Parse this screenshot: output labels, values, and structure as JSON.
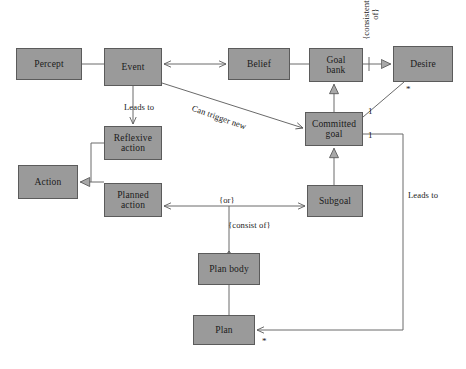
{
  "diagram": {
    "type": "uml-class-diagram",
    "canvas": {
      "width": 466,
      "height": 369,
      "background": "#ffffff"
    },
    "style": {
      "node_fill": "#9a9a9a",
      "node_border": "#5b5b5b",
      "edge_color": "#5b5b5b",
      "text_color": "#1a1a1a"
    },
    "nodes": [
      {
        "id": "percept",
        "label": "Percept",
        "x": 16,
        "y": 48,
        "w": 66,
        "h": 32
      },
      {
        "id": "event",
        "label": "Event",
        "x": 104,
        "y": 48,
        "w": 58,
        "h": 38
      },
      {
        "id": "belief",
        "label": "Belief",
        "x": 228,
        "y": 48,
        "w": 62,
        "h": 32
      },
      {
        "id": "goal_bank",
        "label": "Goal\nbank",
        "x": 309,
        "y": 48,
        "w": 54,
        "h": 34
      },
      {
        "id": "desire",
        "label": "Desire",
        "x": 393,
        "y": 46,
        "w": 60,
        "h": 36
      },
      {
        "id": "committed_goal",
        "label": "Committed\ngoal",
        "x": 305,
        "y": 112,
        "w": 58,
        "h": 34
      },
      {
        "id": "reflexive",
        "label": "Reflexive\naction",
        "x": 104,
        "y": 126,
        "w": 58,
        "h": 34
      },
      {
        "id": "action",
        "label": "Action",
        "x": 18,
        "y": 165,
        "w": 60,
        "h": 34
      },
      {
        "id": "planned",
        "label": "Planned\naction",
        "x": 104,
        "y": 183,
        "w": 58,
        "h": 34
      },
      {
        "id": "subgoal",
        "label": "Subgoal",
        "x": 307,
        "y": 185,
        "w": 56,
        "h": 32
      },
      {
        "id": "plan_body",
        "label": "Plan body",
        "x": 198,
        "y": 253,
        "w": 62,
        "h": 32
      },
      {
        "id": "plan",
        "label": "Plan",
        "x": 193,
        "y": 315,
        "w": 62,
        "h": 30
      }
    ],
    "edge_labels": [
      {
        "id": "leads-to-reflexive",
        "text": "Leads to",
        "x": 124,
        "y": 102
      },
      {
        "id": "can-trigger-new",
        "text": "Can trigger new",
        "x": 194,
        "y": 103
      },
      {
        "id": "consistent-set-of",
        "text": "{consistent set of}",
        "x": 366,
        "y": 46
      },
      {
        "id": "or",
        "text": "{or}",
        "x": 219,
        "y": 196
      },
      {
        "id": "consist-of",
        "text": "{consist of}",
        "x": 228,
        "y": 221
      },
      {
        "id": "leads-to-plan",
        "text": "Leads to",
        "x": 406,
        "y": 192
      }
    ],
    "multiplicities": [
      {
        "id": "desire-star",
        "text": "*",
        "x": 406,
        "y": 88
      },
      {
        "id": "committed-one-upper",
        "text": "1",
        "x": 368,
        "y": 110
      },
      {
        "id": "committed-one-lower",
        "text": "1",
        "x": 368,
        "y": 133
      },
      {
        "id": "plan-star",
        "text": "*",
        "x": 262,
        "y": 342
      }
    ],
    "edges": [
      {
        "id": "percept-event",
        "from": "percept",
        "to": "event",
        "kind": "association",
        "arrows": "none"
      },
      {
        "id": "event-belief",
        "from": "event",
        "to": "belief",
        "kind": "association",
        "arrows": "both"
      },
      {
        "id": "belief-goalbank",
        "from": "belief",
        "to": "goal_bank",
        "kind": "association",
        "arrows": "none"
      },
      {
        "id": "goalbank-desire",
        "from": "goal_bank",
        "to": "desire",
        "kind": "generalization",
        "arrows": "target"
      },
      {
        "id": "committed-goalbank",
        "from": "committed_goal",
        "to": "goal_bank",
        "kind": "generalization",
        "arrows": "target"
      },
      {
        "id": "committed-desire",
        "from": "committed_goal",
        "to": "desire",
        "kind": "association",
        "arrows": "none"
      },
      {
        "id": "event-reflexive",
        "from": "event",
        "to": "reflexive",
        "kind": "association",
        "arrows": "target"
      },
      {
        "id": "event-committed",
        "from": "event",
        "to": "committed_goal",
        "kind": "association",
        "arrows": "target"
      },
      {
        "id": "reflexive-action",
        "from": "reflexive",
        "to": "action",
        "kind": "generalization",
        "arrows": "target"
      },
      {
        "id": "planned-action",
        "from": "planned",
        "to": "action",
        "kind": "generalization",
        "arrows": "target"
      },
      {
        "id": "subgoal-committed",
        "from": "subgoal",
        "to": "committed_goal",
        "kind": "generalization",
        "arrows": "target"
      },
      {
        "id": "planned-subgoal",
        "from": "planned",
        "to": "subgoal",
        "kind": "association",
        "arrows": "both"
      },
      {
        "id": "planbody-or-junction",
        "from": "plan_body",
        "to": "planned-subgoal",
        "kind": "aggregation",
        "arrows": "diamond"
      },
      {
        "id": "planbody-plan",
        "from": "plan_body",
        "to": "plan",
        "kind": "association",
        "arrows": "none"
      },
      {
        "id": "committed-plan",
        "from": "committed_goal",
        "to": "plan",
        "kind": "association",
        "arrows": "target"
      }
    ]
  }
}
